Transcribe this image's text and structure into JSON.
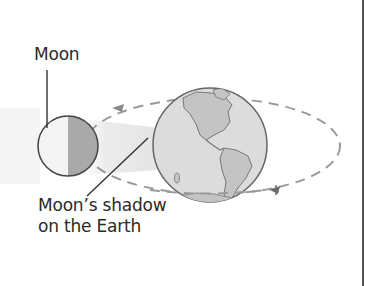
{
  "diagram": {
    "title_fragment": "...",
    "labels": {
      "moon": "Moon",
      "shadow_line1": "Moon’s shadow",
      "shadow_line2": "on the Earth"
    },
    "colors": {
      "earth_fill": "#d9d9d9",
      "land_fill": "#bdbdbd",
      "moon_lit": "#f2f2f2",
      "moon_dark": "#a8a8a8",
      "orbit": "#9a9a9a",
      "shadow_cone": "#ededed",
      "text": "#2a2a2a",
      "outline": "#555555"
    },
    "elements": [
      "moon",
      "earth",
      "orbit",
      "shadow-cone",
      "leader-lines",
      "direction-arrows"
    ]
  }
}
